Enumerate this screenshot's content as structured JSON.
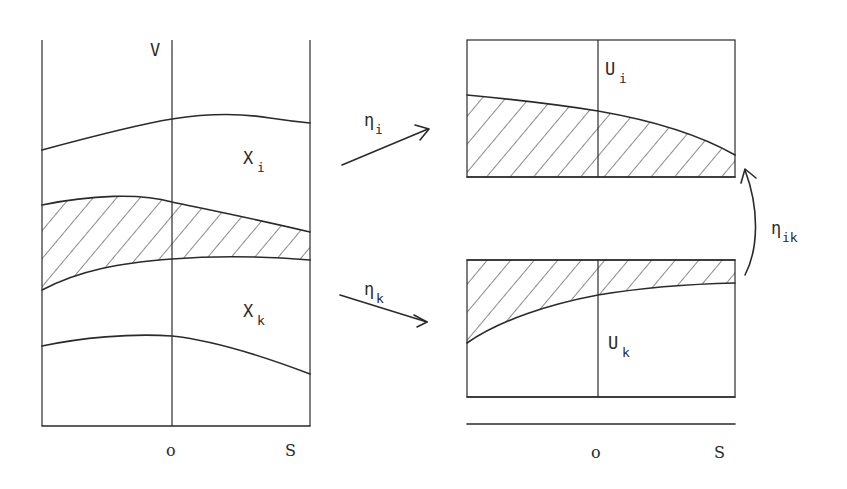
{
  "left_panel": {
    "axis_label_v": "V",
    "region_i": {
      "base": "X",
      "sub": "i"
    },
    "region_k": {
      "base": "X",
      "sub": "k"
    },
    "tick_origin": "o",
    "tick_end": "S"
  },
  "right_top_panel": {
    "label": {
      "base": "U",
      "sub": "i"
    }
  },
  "right_bottom_panel": {
    "label": {
      "base": "U",
      "sub": "k"
    },
    "tick_origin": "o",
    "tick_end": "S"
  },
  "arrows": {
    "eta_i": {
      "base": "η",
      "sub": "i"
    },
    "eta_k": {
      "base": "η",
      "sub": "k"
    },
    "eta_ik": {
      "base": "η",
      "sub": "ik"
    }
  },
  "colors": {
    "ink": "#2a2a2a",
    "background": "#ffffff"
  }
}
